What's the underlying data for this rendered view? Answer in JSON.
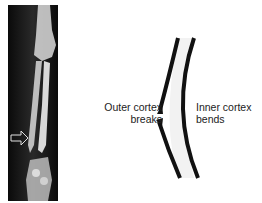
{
  "figure": {
    "panel_left": {
      "type": "x-ray",
      "arrow": "hollow-right-arrow"
    },
    "panel_right": {
      "type": "greenstick-fracture-schematic",
      "labels": {
        "outer_line1": "Outer cortex",
        "outer_line2": "breaks",
        "inner_line1": "Inner cortex",
        "inner_line2": "bends"
      }
    }
  }
}
